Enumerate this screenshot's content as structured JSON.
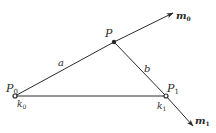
{
  "diagram": {
    "points": {
      "P0": {
        "label": "P",
        "sub": "0",
        "x": 15,
        "y": 96
      },
      "P": {
        "label": "P",
        "sub": "",
        "x": 114,
        "y": 42
      },
      "P1": {
        "label": "P",
        "sub": "1",
        "x": 166,
        "y": 96
      }
    },
    "knot_labels": {
      "k0": {
        "label": "k",
        "sub": "0"
      },
      "k1": {
        "label": "k",
        "sub": "1"
      }
    },
    "segments": {
      "a": {
        "label": "a"
      },
      "b": {
        "label": "b"
      }
    },
    "vectors": {
      "m0": {
        "label": "m",
        "sub": "0"
      },
      "m1": {
        "label": "m",
        "sub": "1"
      }
    },
    "colors": {
      "line": "#2a2a2a",
      "background": "#ffffff"
    }
  }
}
